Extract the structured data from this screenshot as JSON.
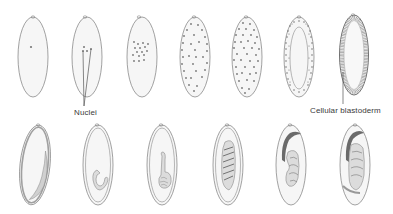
{
  "figure": {
    "rows": 2,
    "colors": {
      "outline": "#8a8a8a",
      "fill": "#f5f5f5",
      "nuclei": "#7a7a7a",
      "tissue": "#9a9a9a",
      "dark_band": "#5e5e5e",
      "label": "#3a3a3a"
    }
  },
  "labels": {
    "nuclei": "Nuclei",
    "cellular_blastoderm": "Cellular blastoderm"
  },
  "stages": {
    "top_row": [
      {
        "index": 1,
        "description": "single nucleus",
        "cx": 33,
        "cy": 57
      },
      {
        "index": 2,
        "description": "few nuclei (labeled Nuclei)",
        "cx": 87,
        "cy": 57
      },
      {
        "index": 3,
        "description": "nuclei dividing in center",
        "cx": 142,
        "cy": 57
      },
      {
        "index": 4,
        "description": "nuclei spreading through yolk",
        "cx": 195,
        "cy": 57
      },
      {
        "index": 5,
        "description": "many nuclei throughout",
        "cx": 247,
        "cy": 57
      },
      {
        "index": 6,
        "description": "syncytial blastoderm (nuclei at periphery)",
        "cx": 299,
        "cy": 57
      },
      {
        "index": 7,
        "description": "cellular blastoderm",
        "cx": 354,
        "cy": 55
      }
    ],
    "bottom_row": [
      {
        "index": 8,
        "description": "gastrulation",
        "cx": 35,
        "cy": 165
      },
      {
        "index": 9,
        "description": "germ band extension begins",
        "cx": 98,
        "cy": 165
      },
      {
        "index": 10,
        "description": "germ band extended",
        "cx": 162,
        "cy": 165
      },
      {
        "index": 11,
        "description": "segmented germ band",
        "cx": 228,
        "cy": 165
      },
      {
        "index": 12,
        "description": "germ band retraction",
        "cx": 291,
        "cy": 165
      },
      {
        "index": 13,
        "description": "late embryo",
        "cx": 355,
        "cy": 165
      }
    ]
  }
}
